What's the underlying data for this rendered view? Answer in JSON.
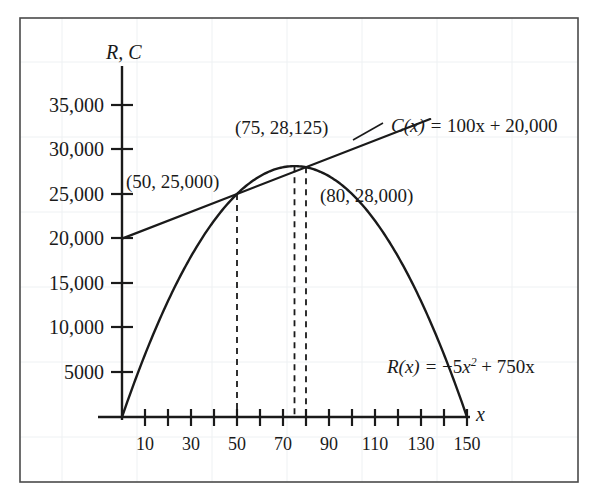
{
  "chart_data": {
    "type": "line",
    "title": "",
    "subtitle": "",
    "xlabel": "x",
    "ylabel": "R, C",
    "xlim": [
      -5,
      160
    ],
    "ylim": [
      0,
      37500
    ],
    "grid": "faint-background-grid-only",
    "legend": "inline-curve-labels",
    "x_ticks_major": [
      10,
      30,
      50,
      70,
      90,
      110,
      130,
      150
    ],
    "x_ticks_minor": [
      20,
      40,
      60,
      80,
      100,
      120,
      140
    ],
    "x_tick_labels": [
      "10",
      "30",
      "50",
      "70",
      "90",
      "110",
      "130",
      "150"
    ],
    "y_ticks": [
      5000,
      10000,
      15000,
      20000,
      25000,
      30000,
      35000
    ],
    "y_tick_labels": [
      "5000",
      "10,000",
      "15,000",
      "20,000",
      "25,000",
      "30,000",
      "35,000"
    ],
    "series": [
      {
        "name": "R(x)",
        "equation": "R(x) = −5x² + 750x",
        "equation_lhs": "R(x) = ",
        "equation_coef": "−5",
        "equation_var": "x",
        "equation_exp": "2",
        "equation_tail": " + 750x",
        "type": "parabola",
        "a": -5,
        "b": 750,
        "c": 0,
        "x_range": [
          0,
          150
        ],
        "vertex": [
          75,
          28125
        ],
        "roots": [
          0,
          150
        ],
        "color": "#1a1a1a"
      },
      {
        "name": "C(x)",
        "equation": "C(x) = 100x + 20,000",
        "equation_lhs": "C(x) = ",
        "equation_tail": "100x + 20,000",
        "type": "line",
        "slope": 100,
        "intercept": 20000,
        "x_range": [
          0,
          134
        ],
        "color": "#1a1a1a"
      }
    ],
    "annotations": [
      {
        "id": "break-even-low",
        "text": "(50, 25,000)",
        "x": 50,
        "y": 25000
      },
      {
        "id": "max-revenue",
        "text": "(75, 28,125)",
        "x": 75,
        "y": 28125
      },
      {
        "id": "break-even-high",
        "text": "(80, 28,000)",
        "x": 80,
        "y": 28000
      }
    ],
    "dashed_verticals": [
      {
        "x": 50,
        "y_top": 25000
      },
      {
        "x": 75,
        "y_top": 28125
      },
      {
        "x": 80,
        "y_top": 28000
      }
    ]
  },
  "labels": {
    "y_axis_name": "R, C",
    "x_axis_name": "x",
    "point_50": "(50, 25,000)",
    "point_75": "(75, 28,125)",
    "point_80": "(80, 28,000)",
    "cost_eq_lhs": "C(x) = ",
    "cost_eq_rhs": "100x + 20,000",
    "rev_eq_lhs": "R(x) = ",
    "rev_eq_coef": "−5",
    "rev_eq_var": "x",
    "rev_eq_exp": "2",
    "rev_eq_tail": " + 750x",
    "y_ticks": [
      "35,000",
      "30,000",
      "25,000",
      "20,000",
      "15,000",
      "10,000",
      "5000"
    ],
    "x_ticks": [
      "10",
      "30",
      "50",
      "70",
      "90",
      "110",
      "130",
      "150"
    ]
  },
  "colors": {
    "ink": "#1a1a1a",
    "frame": "#3a3a3a",
    "background": "#ffffff",
    "faint_grid": "#eef0f2"
  }
}
